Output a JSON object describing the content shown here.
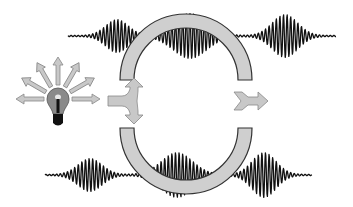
{
  "diagram": {
    "title": "Interferometer with light source and wave packets",
    "canvas": {
      "width": 353,
      "height": 207,
      "background": "#ffffff"
    },
    "colors": {
      "wave": "#111111",
      "arc_fill": "#cfcfcf",
      "arc_stroke": "#333333",
      "arrow_fill": "#c8c8c8",
      "arrow_stroke": "#888888",
      "bulb_glass": "#8a8a8a",
      "bulb_base": "#111111"
    },
    "waves": {
      "top": {
        "baseline_y": 36,
        "x_start": 68,
        "x_end": 336,
        "packets": [
          {
            "center": 117,
            "width": 16,
            "amp": 16,
            "period": 3.6
          },
          {
            "center": 190,
            "width": 24,
            "amp": 22,
            "period": 3.6
          },
          {
            "center": 285,
            "width": 18,
            "amp": 21,
            "period": 3.6
          }
        ]
      },
      "bottom": {
        "baseline_y": 175,
        "x_start": 45,
        "x_end": 312,
        "packets": [
          {
            "center": 90,
            "width": 17,
            "amp": 16,
            "period": 3.6
          },
          {
            "center": 177,
            "width": 22,
            "amp": 22,
            "period": 3.6
          },
          {
            "center": 264,
            "width": 17,
            "amp": 22,
            "period": 3.6
          }
        ]
      }
    },
    "arcs": {
      "top": {
        "cx": 186,
        "cy": 80,
        "r_outer": 66,
        "r_inner": 52,
        "y_cut": 80,
        "label": "upper-path-arc"
      },
      "bottom": {
        "cx": 186,
        "cy": 128,
        "r_outer": 66,
        "r_inner": 52,
        "y_cut": 128,
        "label": "lower-path-arc"
      }
    },
    "bulb": {
      "cx": 58,
      "cy": 103,
      "rays": 7
    },
    "splitter_arrow": {
      "x": 108,
      "y": 101,
      "label": "beam-splitter"
    },
    "output_arrow": {
      "x": 234,
      "y": 101,
      "label": "output-beam"
    }
  }
}
